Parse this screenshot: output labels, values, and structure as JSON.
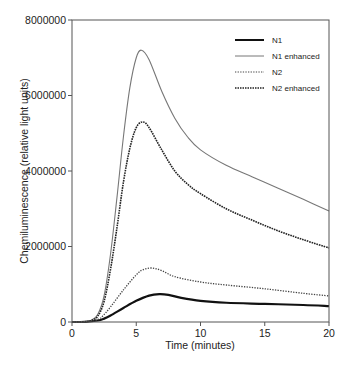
{
  "chart_data": {
    "type": "line",
    "title": "",
    "xlabel": "Time (minutes)",
    "ylabel": "Chemiluminescence (relative light units)",
    "xlim": [
      0,
      20
    ],
    "ylim": [
      0,
      8000000
    ],
    "xticks": [
      0,
      5,
      10,
      15,
      20
    ],
    "xtick_labels": [
      "0",
      "5",
      "10",
      "15",
      "20"
    ],
    "yticks": [
      0,
      2000000,
      4000000,
      6000000,
      8000000
    ],
    "ytick_labels": [
      "0",
      "2000000",
      "4000000",
      "6000000",
      "8000000"
    ],
    "grid": false,
    "legend_position": "upper right",
    "series": [
      {
        "name": "N1",
        "style": "solid-thick",
        "color": "#111111",
        "x": [
          0,
          1,
          2,
          2.5,
          3,
          4,
          5,
          6,
          6.8,
          7.5,
          8.5,
          10,
          12,
          15,
          18,
          20
        ],
        "y": [
          0,
          5000,
          40000,
          90000,
          170000,
          370000,
          560000,
          700000,
          740000,
          720000,
          640000,
          560000,
          510000,
          480000,
          450000,
          420000
        ]
      },
      {
        "name": "N1 enhanced",
        "style": "solid-thin",
        "color": "#777777",
        "x": [
          0,
          1,
          1.5,
          2,
          2.5,
          3,
          3.5,
          4,
          4.5,
          5,
          5.4,
          6,
          7,
          8,
          9,
          10,
          12,
          14,
          16,
          18,
          20
        ],
        "y": [
          0,
          10000,
          50000,
          200000,
          700000,
          1800000,
          3300000,
          4900000,
          6200000,
          7000000,
          7200000,
          6950000,
          6100000,
          5400000,
          4900000,
          4560000,
          4150000,
          3850000,
          3550000,
          3250000,
          2940000
        ]
      },
      {
        "name": "N2",
        "style": "dotted",
        "color": "#444444",
        "x": [
          0,
          1,
          2,
          2.5,
          3,
          4,
          5,
          5.5,
          6.2,
          7,
          8,
          10,
          12,
          15,
          18,
          20
        ],
        "y": [
          0,
          5000,
          60000,
          200000,
          400000,
          850000,
          1250000,
          1380000,
          1430000,
          1360000,
          1200000,
          1060000,
          980000,
          880000,
          760000,
          690000
        ]
      },
      {
        "name": "N2 enhanced",
        "style": "dotted-dense",
        "color": "#222222",
        "x": [
          0,
          1,
          1.5,
          2,
          2.5,
          3,
          3.5,
          4,
          4.5,
          5,
          5.5,
          6,
          7,
          8,
          9,
          10,
          12,
          14,
          16,
          18,
          20
        ],
        "y": [
          0,
          8000,
          40000,
          150000,
          550000,
          1400000,
          2500000,
          3700000,
          4600000,
          5150000,
          5300000,
          5150000,
          4550000,
          4000000,
          3650000,
          3400000,
          3000000,
          2700000,
          2420000,
          2180000,
          1960000
        ]
      }
    ]
  },
  "legend": {
    "items": [
      {
        "label": "N1"
      },
      {
        "label": "N1 enhanced"
      },
      {
        "label": "N2"
      },
      {
        "label": "N2 enhanced"
      }
    ]
  },
  "axes": {
    "xlabel": "Time (minutes)",
    "ylabel": "Chemiluminescence (relative light units)"
  }
}
